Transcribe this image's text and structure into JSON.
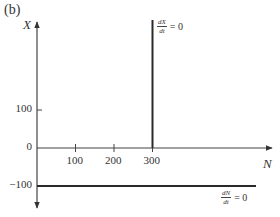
{
  "panel_label": "(b)",
  "axes": {
    "y_name": "X",
    "x_name": "N",
    "y_ticks": [
      {
        "value": 100,
        "label": "100"
      },
      {
        "value": 0,
        "label": "0"
      },
      {
        "value": -100,
        "label": "−100"
      }
    ],
    "x_ticks": [
      {
        "value": 100,
        "label": "100"
      },
      {
        "value": 200,
        "label": "200"
      },
      {
        "value": 300,
        "label": "300"
      }
    ]
  },
  "nullclines": [
    {
      "id": "dX",
      "orientation": "vertical",
      "N": 300,
      "numerator": "dX",
      "denominator": "dt",
      "rhs": "= 0"
    },
    {
      "id": "dN",
      "orientation": "horizontal",
      "X": -100,
      "numerator": "dN",
      "denominator": "dt",
      "rhs": "= 0"
    }
  ],
  "colors": {
    "axis": "#444444",
    "nullcline": "#2a2a2a",
    "text": "#333333"
  }
}
